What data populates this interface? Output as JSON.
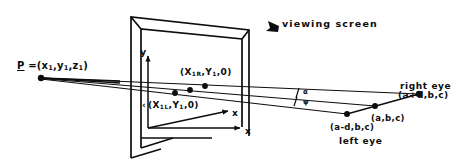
{
  "figure": {
    "type": "line-diagram",
    "background": "#ffffff",
    "ink": "#0d0d0d"
  },
  "labels": {
    "viewing_screen": "viewing screen",
    "point_P_prefix": "P",
    "point_P_rest": " =(x",
    "point_P_sub1": "1",
    "point_P_mid1": ",y",
    "point_P_sub2": "1",
    "point_P_mid2": ",z",
    "point_P_sub3": "1",
    "point_P_close": ")",
    "screen_point_right": "(X",
    "screen_point_right_sub": "1R",
    "screen_point_right_mid": ",Y",
    "screen_point_right_sub2": "1",
    "screen_point_right_end": ",0)",
    "screen_point_left": "(X",
    "screen_point_left_sub": "1L",
    "screen_point_left_mid": ",Y",
    "screen_point_left_sub2": "1",
    "screen_point_left_end": ",0)",
    "axis_y": "y",
    "axis_z": "x",
    "axis_x": "x",
    "right_eye": "right eye",
    "right_eye_coord": "(a+d,b,c)",
    "midpoint_coord": "(a,b,c)",
    "left_eye_coord": "(a-d,b,c)",
    "left_eye": "left eye",
    "angle_upper": "α",
    "angle_lower": "ψ",
    "tick_marker": "‹"
  },
  "geometry": {
    "screen_outer": "130,15 250,29 250,137 130,160",
    "screen_inner": "140,27 243,38 243,128 140,148",
    "origin": [
      148,
      128
    ],
    "y_axis_tip": [
      148,
      54
    ],
    "x_axis_tip": [
      243,
      128
    ],
    "z_axis_tip": [
      232,
      110
    ],
    "point_P": [
      41,
      77
    ],
    "screen_pt_right": [
      205,
      88
    ],
    "screen_pt_left": [
      175,
      95
    ],
    "screen_pt_mid": [
      190,
      92
    ],
    "right_eye": [
      419,
      94
    ],
    "mid_eye": [
      375,
      106
    ],
    "left_eye": [
      347,
      114
    ]
  }
}
